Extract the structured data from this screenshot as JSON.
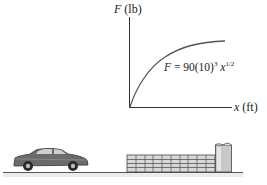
{
  "graph": {
    "y_axis_label_var": "F",
    "y_axis_label_unit": "(lb)",
    "x_axis_label_var": "x",
    "x_axis_label_unit": "(ft)",
    "equation_lhs": "F",
    "equation_mid": " = 90(10)",
    "equation_exp1": "3",
    "equation_var": " x",
    "equation_exp2": "1/2",
    "curve": "F = 90(10)^3 x^(1/2)"
  },
  "illustration": {
    "objects": [
      "car",
      "crash-barrier",
      "cylinder-post",
      "ground-line"
    ]
  }
}
